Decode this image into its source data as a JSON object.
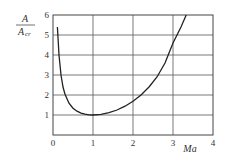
{
  "chart_data": {
    "type": "line",
    "title": "",
    "xlabel": "Ma",
    "ylabel": "A / A_cr",
    "ylabel_parts": {
      "numerator": "A",
      "denominator": "A",
      "denominator_sub": "cr"
    },
    "xlim": [
      0,
      4
    ],
    "ylim": [
      0,
      6
    ],
    "xticks": [
      "0",
      "1",
      "2",
      "3",
      "4"
    ],
    "yticks": [
      "1",
      "2",
      "3",
      "4",
      "5",
      "6"
    ],
    "grid": true,
    "legend": null,
    "series": [
      {
        "name": "A/A_cr vs Ma",
        "x": [
          0.11,
          0.15,
          0.2,
          0.25,
          0.3,
          0.4,
          0.5,
          0.6,
          0.7,
          0.8,
          0.9,
          1.0,
          1.2,
          1.4,
          1.6,
          1.8,
          2.0,
          2.2,
          2.4,
          2.6,
          2.8,
          3.0,
          3.2,
          3.33
        ],
        "y": [
          5.4,
          4.0,
          3.0,
          2.4,
          2.04,
          1.59,
          1.34,
          1.19,
          1.09,
          1.04,
          1.01,
          1.0,
          1.03,
          1.12,
          1.25,
          1.44,
          1.69,
          2.0,
          2.4,
          2.9,
          3.6,
          4.6,
          5.4,
          6.0
        ]
      }
    ]
  }
}
